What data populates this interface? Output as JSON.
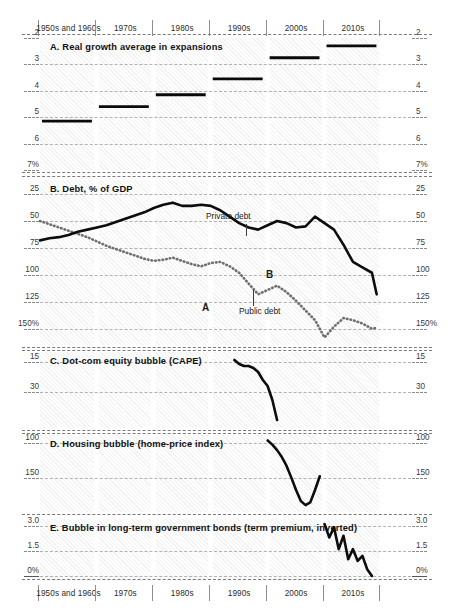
{
  "figure": {
    "decades": [
      "1950s and 1960s",
      "1970s",
      "1980s",
      "1990s",
      "2000s",
      "2010s"
    ],
    "hatch_color": "#f2f2f2",
    "line_color": "#0d0d0d",
    "dotted_color": "#6f6f6f"
  },
  "chart_data": [
    {
      "type": "bar",
      "panel": "A",
      "title": "A. Real growth average in expansions",
      "xlabel": "",
      "ylabel": "",
      "ylim": [
        2,
        7
      ],
      "grid": true,
      "legend": "none",
      "categories": [
        "1950s and 1960s",
        "1970s",
        "1980s",
        "1990s",
        "2000s",
        "2010s"
      ],
      "values": [
        5.15,
        4.6,
        4.15,
        3.55,
        2.75,
        2.3
      ],
      "ticks_left": [
        "7%",
        "6",
        "5",
        "4",
        "3",
        "2"
      ],
      "ticks_right": [
        "7%",
        "6",
        "5",
        "4",
        "3",
        "2"
      ],
      "tick_values": [
        7,
        6,
        5,
        4,
        3,
        2
      ]
    },
    {
      "type": "line",
      "panel": "B",
      "title": "B. Debt, % of GDP",
      "xlabel": "",
      "ylabel": "",
      "ylim": [
        12,
        165
      ],
      "grid": true,
      "legend": "inline-annotations",
      "ticks_left": [
        "150%",
        "125",
        "100",
        "75",
        "50",
        "25"
      ],
      "ticks_right": [
        "150%",
        "125",
        "100",
        "75",
        "50",
        "25"
      ],
      "tick_values": [
        150,
        125,
        100,
        75,
        50,
        25
      ],
      "annotations": [
        {
          "text": "Private debt",
          "series": "private_debt",
          "x_decade": "1990s"
        },
        {
          "text": "Public debt",
          "series": "public_debt",
          "x_decade": "1990s"
        },
        {
          "text": "A",
          "series": "public_debt",
          "x_decade": "1990s"
        },
        {
          "text": "B",
          "series": "public_debt",
          "x_decade": "1990s"
        }
      ],
      "series": [
        {
          "name": "Private debt",
          "style": "dotted",
          "x": [
            1950,
            1952,
            1954,
            1956,
            1958,
            1960,
            1962,
            1964,
            1966,
            1968,
            1970,
            1972,
            1974,
            1976,
            1978,
            1980,
            1982,
            1984,
            1986,
            1988,
            1990,
            1992,
            1994,
            1996,
            1998,
            2000,
            2002,
            2004,
            2006,
            2008,
            2010,
            2012,
            2014,
            2016,
            2018,
            2020,
            2021
          ],
          "values": [
            50,
            53,
            56,
            59,
            62,
            65,
            69,
            73,
            76,
            79,
            82,
            85,
            87,
            86,
            84,
            87,
            90,
            92,
            89,
            88,
            92,
            98,
            108,
            118,
            114,
            110,
            116,
            124,
            133,
            142,
            158,
            148,
            140,
            142,
            145,
            150,
            149
          ]
        },
        {
          "name": "Public debt",
          "style": "solid",
          "x": [
            1950,
            1952,
            1954,
            1956,
            1958,
            1960,
            1962,
            1964,
            1966,
            1968,
            1970,
            1972,
            1974,
            1976,
            1978,
            1980,
            1982,
            1984,
            1986,
            1988,
            1990,
            1992,
            1994,
            1996,
            1998,
            2000,
            2002,
            2004,
            2006,
            2008,
            2010,
            2012,
            2014,
            2016,
            2018,
            2020,
            2021
          ],
          "values": [
            68,
            66,
            65,
            63,
            60,
            58,
            56,
            54,
            51,
            48,
            45,
            42,
            38,
            35,
            33,
            36,
            36,
            35,
            36,
            40,
            46,
            52,
            56,
            58,
            54,
            50,
            52,
            56,
            55,
            46,
            52,
            58,
            72,
            88,
            93,
            98,
            118,
            112
          ]
        }
      ]
    },
    {
      "type": "line",
      "panel": "C",
      "title": "C. Dot-com equity bubble (CAPE)",
      "xlabel": "",
      "ylabel": "",
      "ylim": [
        10,
        48
      ],
      "grid": true,
      "legend": "none",
      "ticks_left": [
        "30",
        "15"
      ],
      "ticks_right": [
        "30",
        "15"
      ],
      "tick_values": [
        30,
        15
      ],
      "series": [
        {
          "name": "CAPE",
          "style": "solid",
          "x": [
            1991,
            1992,
            1993,
            1994,
            1995,
            1996,
            1997,
            1998,
            1999,
            2000
          ],
          "values": [
            14,
            16,
            17,
            17,
            18,
            20,
            24,
            27,
            34,
            44
          ]
        }
      ]
    },
    {
      "type": "line",
      "panel": "D",
      "title": "D. Housing bubble (home-price index)",
      "xlabel": "",
      "ylabel": "",
      "ylim": [
        88,
        200
      ],
      "grid": true,
      "legend": "none",
      "ticks_left": [
        "150",
        "100"
      ],
      "ticks_right": [
        "150",
        "100"
      ],
      "tick_values": [
        150,
        100
      ],
      "series": [
        {
          "name": "Home-price index",
          "style": "solid",
          "x": [
            1998,
            1999,
            2000,
            2001,
            2002,
            2003,
            2004,
            2005,
            2006,
            2007,
            2008,
            2009
          ],
          "values": [
            96,
            102,
            110,
            120,
            133,
            150,
            168,
            184,
            190,
            186,
            168,
            148
          ]
        }
      ]
    },
    {
      "type": "line",
      "panel": "E",
      "title": "E. Bubble in long-term government bonds (term premium, inverted)",
      "xlabel": "",
      "ylabel": "",
      "ylim": [
        3.4,
        -0.3
      ],
      "inverted": true,
      "grid": true,
      "legend": "none",
      "ticks_left": [
        "0%",
        "1.5",
        "3.0"
      ],
      "ticks_right": [
        "0%",
        "1.5",
        "3.0"
      ],
      "tick_values": [
        0,
        1.5,
        3.0
      ],
      "series": [
        {
          "name": "Term premium (inverted)",
          "style": "solid",
          "x": [
            2010,
            2011,
            2012,
            2013,
            2014,
            2015,
            2016,
            2017,
            2018,
            2019,
            2020
          ],
          "values": [
            3.1,
            2.3,
            2.9,
            1.6,
            2.4,
            1.0,
            1.6,
            0.9,
            1.2,
            0.4,
            0.0
          ]
        }
      ]
    }
  ]
}
